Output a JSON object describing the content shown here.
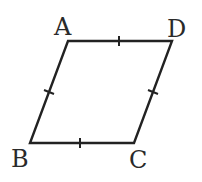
{
  "diagram": {
    "shape": "rhombus",
    "stroke_color": "#222222",
    "vertices": [
      {
        "label": "A",
        "x": 68,
        "y": 41
      },
      {
        "label": "D",
        "x": 172,
        "y": 41
      },
      {
        "label": "C",
        "x": 134,
        "y": 143
      },
      {
        "label": "B",
        "x": 30,
        "y": 143
      }
    ],
    "labels": {
      "A": "A",
      "B": "B",
      "C": "C",
      "D": "D"
    },
    "tick_marks": "one tick on each side (all sides equal)"
  }
}
